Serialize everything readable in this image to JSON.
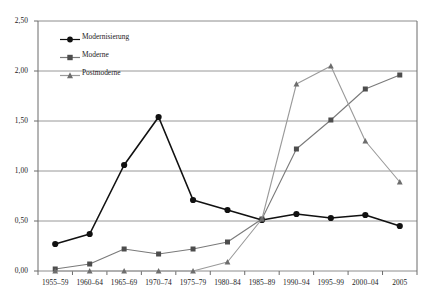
{
  "chart_data": {
    "type": "line",
    "title": "",
    "xlabel": "",
    "ylabel": "",
    "grid": true,
    "legend_position": "top-left",
    "ylim": [
      0.0,
      2.5
    ],
    "ytick_labels": [
      "2,50",
      "2,00",
      "1,50",
      "1,00",
      "0,50",
      "0,00"
    ],
    "ytick_values": [
      2.5,
      2.0,
      1.5,
      1.0,
      0.5,
      0.0
    ],
    "categories": [
      "1955–59",
      "1960–64",
      "1965–69",
      "1970–74",
      "1975–79",
      "1980–84",
      "1985–89",
      "1990–94",
      "1995–99",
      "2000–04",
      "2005"
    ],
    "series": [
      {
        "name": "Modernisierung",
        "color": "#111111",
        "marker": "circle",
        "values": [
          0.27,
          0.37,
          1.06,
          1.54,
          0.71,
          0.61,
          0.51,
          0.57,
          0.53,
          0.56,
          0.45
        ]
      },
      {
        "name": "Moderne",
        "color": "#7a7a7a",
        "marker": "square",
        "values": [
          0.02,
          0.07,
          0.22,
          0.17,
          0.22,
          0.29,
          0.52,
          1.22,
          1.51,
          1.82,
          1.96
        ]
      },
      {
        "name": "Postmoderne",
        "color": "#9a9a9a",
        "marker": "triangle",
        "values": [
          0.0,
          0.0,
          0.0,
          0.0,
          0.0,
          0.09,
          0.52,
          1.87,
          2.05,
          1.3,
          0.89
        ]
      }
    ]
  },
  "legend": {
    "items": [
      {
        "label": "Modernisierung"
      },
      {
        "label": "Moderne"
      },
      {
        "label": "Postmoderne"
      }
    ]
  },
  "colors": {
    "series_1": "#111111",
    "series_2": "#7a7a7a",
    "series_3": "#9a9a9a",
    "grid": "#8c8c8c",
    "axis": "#6b6b6b",
    "text": "#1a1a1a",
    "background": "#ffffff"
  }
}
